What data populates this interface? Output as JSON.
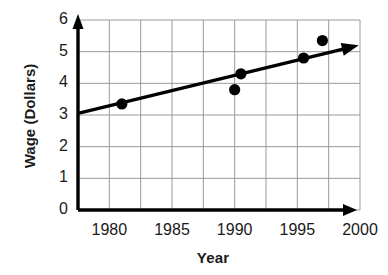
{
  "chart_data": {
    "type": "scatter",
    "title": "",
    "xlabel": "Year",
    "ylabel": "Wage (Dollars)",
    "xlim": [
      1977.5,
      2000
    ],
    "ylim": [
      0,
      6
    ],
    "grid": true,
    "legend": null,
    "x_ticks": [
      1980,
      1985,
      1990,
      1995,
      2000
    ],
    "x_tick_labels": [
      "1980",
      "1985",
      "1990",
      "1995",
      "2000"
    ],
    "y_ticks": [
      0,
      1,
      2,
      3,
      4,
      5,
      6
    ],
    "y_tick_labels": [
      "0",
      "1",
      "2",
      "3",
      "4",
      "5",
      "6"
    ],
    "points": [
      {
        "x": 1981,
        "y": 3.35
      },
      {
        "x": 1990.5,
        "y": 4.3
      },
      {
        "x": 1990,
        "y": 3.8
      },
      {
        "x": 1995.5,
        "y": 4.8
      },
      {
        "x": 1997,
        "y": 5.35
      }
    ],
    "trend_line": {
      "name": "line of best fit",
      "x_start": 1977.5,
      "y_start": 3.05,
      "x_end": 1999.9,
      "y_end": 5.2,
      "arrow_end": true
    },
    "marker_color": "#000000",
    "line_color": "#000000",
    "grid_color": "#9a9a9a",
    "axis_color": "#000000"
  },
  "geometry": {
    "x0": 78,
    "x1": 360,
    "y0": 210,
    "y1": 20,
    "grid_step_x": 16.0,
    "grid_step_y": 31.7
  }
}
